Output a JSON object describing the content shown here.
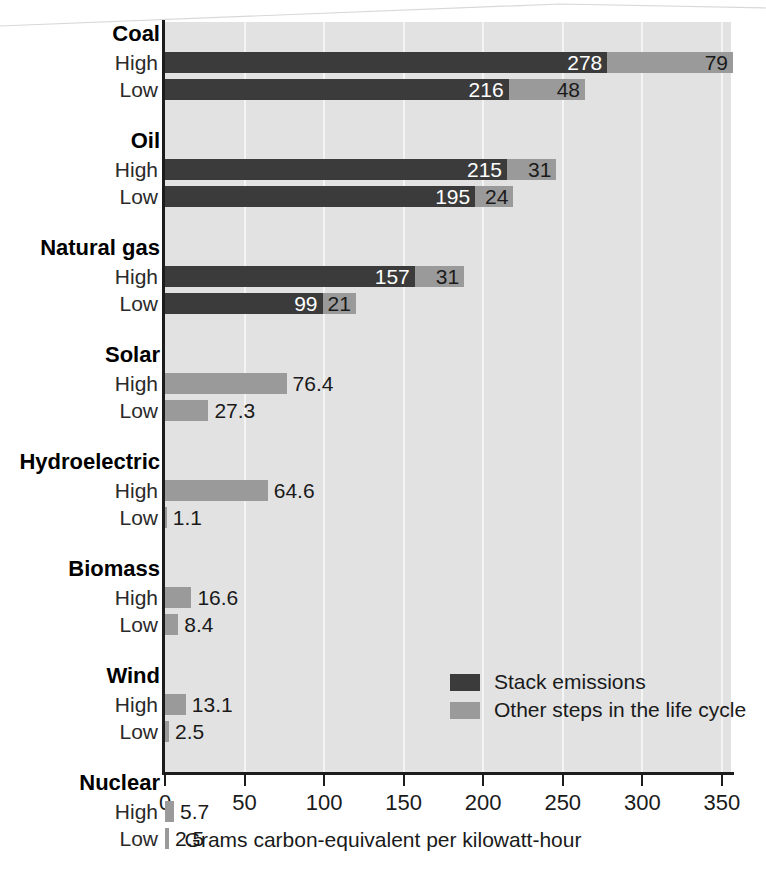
{
  "chart_data": {
    "type": "bar",
    "orientation": "horizontal",
    "stacked": true,
    "title": "",
    "xlabel": "Grams carbon-equivalent per kilowatt-hour",
    "ylabel": "",
    "xlim": [
      0,
      360
    ],
    "xticks": [
      0,
      50,
      100,
      150,
      200,
      250,
      300,
      350
    ],
    "xtick_labels": [
      "0",
      "50",
      "100",
      "150",
      "200",
      "250",
      "300",
      "350"
    ],
    "grid": "vertical-white-on-gray",
    "legend": {
      "position": "inside-bottom-right",
      "entries": [
        {
          "name": "Stack emissions",
          "color": "#3b3b3b",
          "key": "stack"
        },
        {
          "name": "Other steps in the life cycle",
          "color": "#9a9a9a",
          "key": "other"
        }
      ]
    },
    "series": [
      {
        "name": "Stack emissions",
        "key": "stack",
        "color": "#3b3b3b"
      },
      {
        "name": "Other steps in the life cycle",
        "key": "other",
        "color": "#9a9a9a"
      }
    ],
    "groups": [
      {
        "label": "Coal",
        "rows": [
          {
            "label": "High",
            "stack": 278,
            "other": 79,
            "stack_text": "278",
            "other_text": "79",
            "stack_text_inside": true,
            "other_text_inside": true
          },
          {
            "label": "Low",
            "stack": 216,
            "other": 48,
            "stack_text": "216",
            "other_text": "48",
            "stack_text_inside": true,
            "other_text_inside": true
          }
        ]
      },
      {
        "label": "Oil",
        "rows": [
          {
            "label": "High",
            "stack": 215,
            "other": 31,
            "stack_text": "215",
            "other_text": "31",
            "stack_text_inside": true,
            "other_text_inside": true
          },
          {
            "label": "Low",
            "stack": 195,
            "other": 24,
            "stack_text": "195",
            "other_text": "24",
            "stack_text_inside": true,
            "other_text_inside": true
          }
        ]
      },
      {
        "label": "Natural gas",
        "rows": [
          {
            "label": "High",
            "stack": 157,
            "other": 31,
            "stack_text": "157",
            "other_text": "31",
            "stack_text_inside": true,
            "other_text_inside": true
          },
          {
            "label": "Low",
            "stack": 99,
            "other": 21,
            "stack_text": "99",
            "other_text": "21",
            "stack_text_inside": true,
            "other_text_inside": true
          }
        ]
      },
      {
        "label": "Solar",
        "rows": [
          {
            "label": "High",
            "stack": 0,
            "other": 76.4,
            "stack_text": "",
            "other_text": "76.4",
            "stack_text_inside": false,
            "other_text_inside": false
          },
          {
            "label": "Low",
            "stack": 0,
            "other": 27.3,
            "stack_text": "",
            "other_text": "27.3",
            "stack_text_inside": false,
            "other_text_inside": false
          }
        ]
      },
      {
        "label": "Hydroelectric",
        "rows": [
          {
            "label": "High",
            "stack": 0,
            "other": 64.6,
            "stack_text": "",
            "other_text": "64.6",
            "stack_text_inside": false,
            "other_text_inside": false
          },
          {
            "label": "Low",
            "stack": 0,
            "other": 1.1,
            "stack_text": "",
            "other_text": "1.1",
            "stack_text_inside": false,
            "other_text_inside": false
          }
        ]
      },
      {
        "label": "Biomass",
        "rows": [
          {
            "label": "High",
            "stack": 0,
            "other": 16.6,
            "stack_text": "",
            "other_text": "16.6",
            "stack_text_inside": false,
            "other_text_inside": false
          },
          {
            "label": "Low",
            "stack": 0,
            "other": 8.4,
            "stack_text": "",
            "other_text": "8.4",
            "stack_text_inside": false,
            "other_text_inside": false
          }
        ]
      },
      {
        "label": "Wind",
        "rows": [
          {
            "label": "High",
            "stack": 0,
            "other": 13.1,
            "stack_text": "",
            "other_text": "13.1",
            "stack_text_inside": false,
            "other_text_inside": false
          },
          {
            "label": "Low",
            "stack": 0,
            "other": 2.5,
            "stack_text": "",
            "other_text": "2.5",
            "stack_text_inside": false,
            "other_text_inside": false
          }
        ]
      },
      {
        "label": "Nuclear",
        "rows": [
          {
            "label": "High",
            "stack": 0,
            "other": 5.7,
            "stack_text": "",
            "other_text": "5.7",
            "stack_text_inside": false,
            "other_text_inside": false
          },
          {
            "label": "Low",
            "stack": 0,
            "other": 2.5,
            "stack_text": "",
            "other_text": "2.5",
            "stack_text_inside": false,
            "other_text_inside": false
          }
        ]
      }
    ]
  },
  "colors": {
    "stack": "#3b3b3b",
    "other": "#9a9a9a",
    "plot_background": "#e2e2e2",
    "gridline": "#f4f4f4",
    "axis": "#1c1c1c",
    "page_background": "#ffffff"
  }
}
